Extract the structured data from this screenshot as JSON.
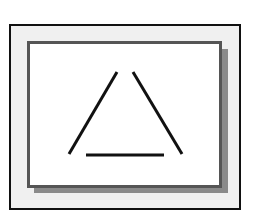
{
  "diagram": {
    "type": "illusory-triangle-figure",
    "colors": {
      "background": "#ffffff",
      "outer_frame_border": "#111111",
      "outer_frame_fill": "#f0f0f0",
      "inner_box_border": "#555555",
      "inner_box_fill": "#ffffff",
      "shadow": "#8a8a8a",
      "stroke": "#111111"
    },
    "lines": [
      {
        "name": "left-side",
        "x1": 117,
        "y1": 72,
        "x2": 69,
        "y2": 154
      },
      {
        "name": "right-side",
        "x1": 133,
        "y1": 72,
        "x2": 182,
        "y2": 154
      },
      {
        "name": "base",
        "x1": 86,
        "y1": 155,
        "x2": 164,
        "y2": 155
      }
    ]
  }
}
